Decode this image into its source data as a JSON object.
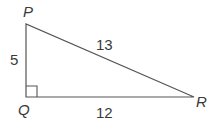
{
  "diagram": {
    "type": "right-triangle",
    "vertices": [
      {
        "name": "P",
        "label": "P"
      },
      {
        "name": "Q",
        "label": "Q",
        "right_angle": true
      },
      {
        "name": "R",
        "label": "R"
      }
    ],
    "sides": [
      {
        "between": "PQ",
        "label": "5"
      },
      {
        "between": "PR",
        "label": "13"
      },
      {
        "between": "QR",
        "label": "12"
      }
    ],
    "colors": {
      "stroke": "#555555",
      "text": "#3a3a3a"
    }
  }
}
